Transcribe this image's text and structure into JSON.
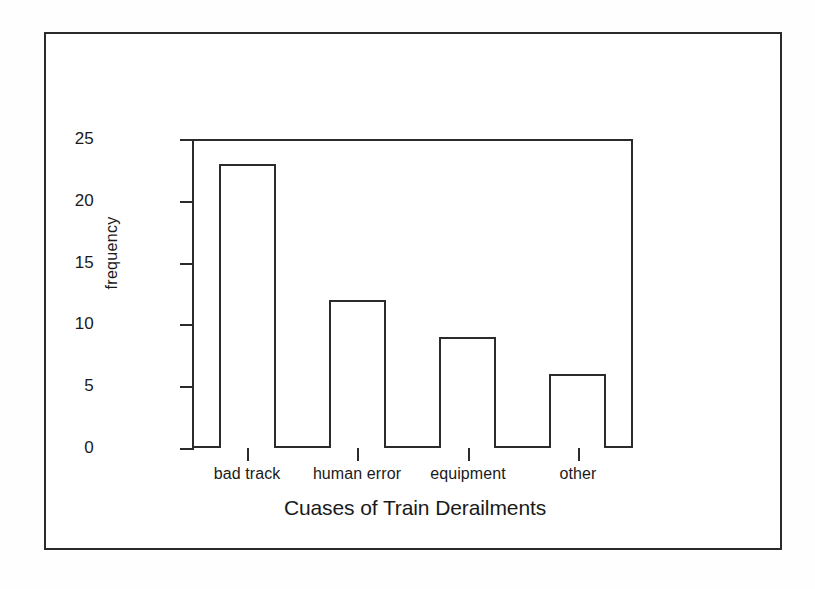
{
  "figure": {
    "background_color": "#ffffff",
    "ink_color": "#2b2b2b"
  },
  "chart_data": {
    "type": "bar",
    "title": "",
    "xlabel": "Cuases of Train Derailments",
    "ylabel": "frequency",
    "categories": [
      "bad track",
      "human error",
      "equipment",
      "other"
    ],
    "values": [
      23,
      12,
      9,
      6
    ],
    "ylim": [
      0,
      25
    ],
    "yticks": [
      0,
      5,
      10,
      15,
      20,
      25
    ],
    "ytick_labels": [
      "0",
      "5",
      "10",
      "15",
      "20",
      "25"
    ],
    "grid": false,
    "legend": null,
    "bar_fill": "#ffffff",
    "bar_edge": "#2b2b2b"
  }
}
